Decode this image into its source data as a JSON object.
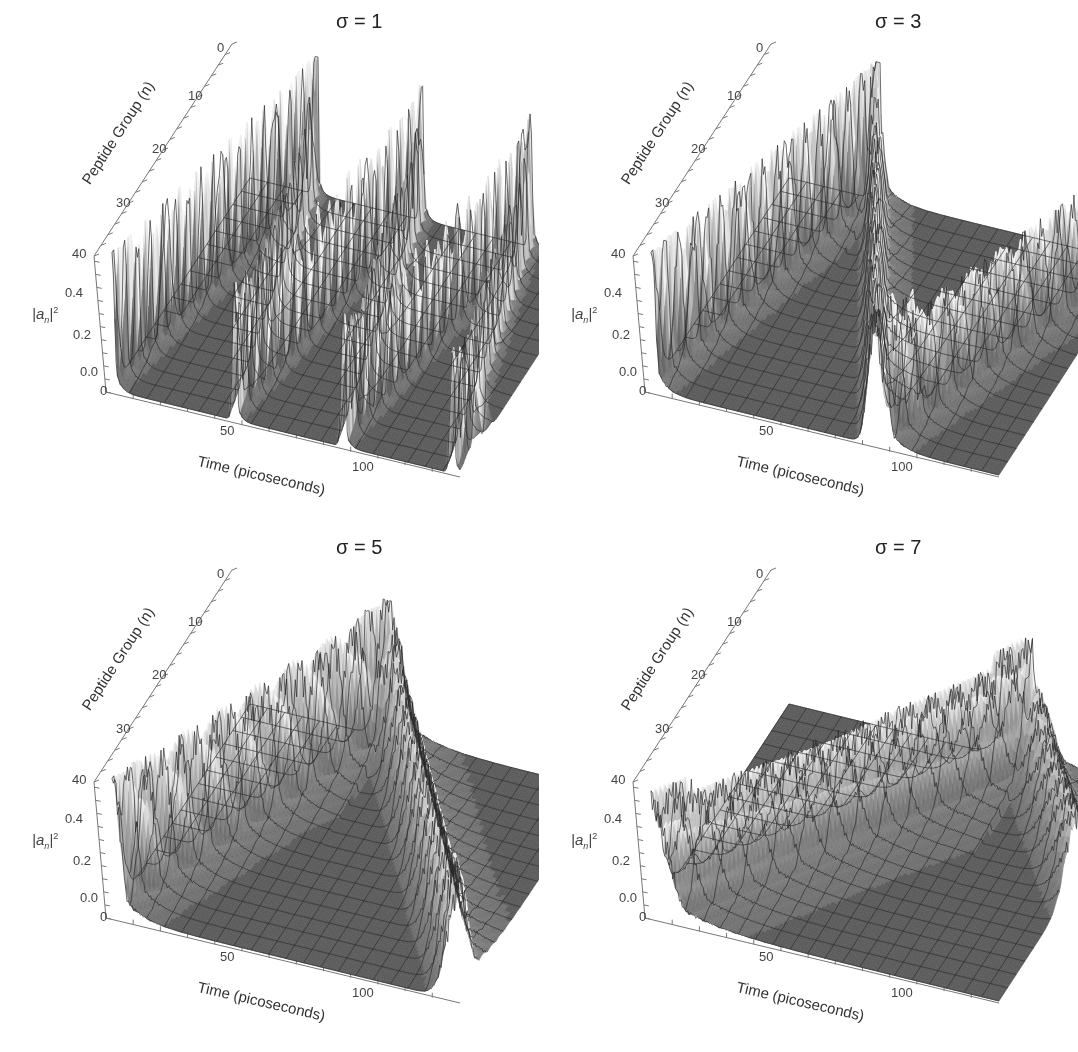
{
  "figure": {
    "panels": [
      {
        "id": "p1",
        "title": "σ = 1",
        "sigma": 1,
        "x": 0,
        "y": 0
      },
      {
        "id": "p2",
        "title": "σ = 3",
        "sigma": 3,
        "x": 539,
        "y": 0
      },
      {
        "id": "p3",
        "title": "σ = 5",
        "sigma": 5,
        "x": 0,
        "y": 526
      },
      {
        "id": "p4",
        "title": "σ = 7",
        "sigma": 7,
        "x": 539,
        "y": 526
      }
    ],
    "axes": {
      "x_title": "Time (picoseconds)",
      "y_title": "Peptide Group (n)",
      "z_title_base": "|a",
      "z_title_sub": "n",
      "z_title_end": "|",
      "z_title_sup": "2",
      "x_ticks": [
        "0",
        "50",
        "100"
      ],
      "y_ticks": [
        "0",
        "10",
        "20",
        "30",
        "40"
      ],
      "z_ticks": [
        "0.0",
        "0.2",
        "0.4"
      ]
    },
    "colors": {
      "surface": "#5c5c5c",
      "grid": "#333333",
      "peak_high": "#f2f2f2",
      "peak_low": "#7a7a7a",
      "axis": "#777777",
      "background": "#ffffff"
    }
  },
  "chart_data": [
    {
      "type": "surface3d",
      "title": "σ = 1",
      "xlabel": "Time (picoseconds)",
      "ylabel": "Peptide Group (n)",
      "zlabel": "|a_n|^2",
      "xlim": [
        0,
        128
      ],
      "ylim": [
        0,
        40
      ],
      "zlim": [
        0,
        0.5
      ],
      "x_ticks": [
        0,
        50,
        100
      ],
      "y_ticks": [
        0,
        10,
        20,
        30,
        40
      ],
      "z_ticks": [
        0.0,
        0.2,
        0.4
      ],
      "description": "Soliton bounces back and forth along the chain repeatedly",
      "ridges": [
        {
          "t_start": 0,
          "n_start": 40,
          "t_end": 24,
          "n_end": 0,
          "peak": 0.5
        },
        {
          "t_start": 24,
          "n_start": 0,
          "t_end": 45,
          "n_end": 40,
          "peak": 0.35
        },
        {
          "t_start": 45,
          "n_start": 40,
          "t_end": 63,
          "n_end": 0,
          "peak": 0.45
        },
        {
          "t_start": 63,
          "n_start": 0,
          "t_end": 85,
          "n_end": 40,
          "peak": 0.35
        },
        {
          "t_start": 85,
          "n_start": 40,
          "t_end": 103,
          "n_end": 0,
          "peak": 0.42
        },
        {
          "t_start": 103,
          "n_start": 0,
          "t_end": 125,
          "n_end": 40,
          "peak": 0.35
        },
        {
          "t_start": 125,
          "n_start": 40,
          "t_end": 128,
          "n_end": 34,
          "peak": 0.4
        }
      ]
    },
    {
      "type": "surface3d",
      "title": "σ = 3",
      "xlabel": "Time (picoseconds)",
      "ylabel": "Peptide Group (n)",
      "zlabel": "|a_n|^2",
      "xlim": [
        0,
        128
      ],
      "ylim": [
        0,
        40
      ],
      "zlim": [
        0,
        0.5
      ],
      "x_ticks": [
        0,
        50,
        100
      ],
      "y_ticks": [
        0,
        10,
        20,
        30,
        40
      ],
      "z_ticks": [
        0.0,
        0.2,
        0.4
      ],
      "description": "Slower soliton, fewer bounces",
      "ridges": [
        {
          "t_start": 0,
          "n_start": 40,
          "t_end": 32,
          "n_end": 0,
          "peak": 0.5
        },
        {
          "t_start": 32,
          "n_start": 0,
          "t_end": 82,
          "n_end": 40,
          "peak": 0.38
        },
        {
          "t_start": 82,
          "n_start": 40,
          "t_end": 88,
          "n_end": 34,
          "peak": 0.45
        },
        {
          "t_start": 85,
          "n_start": 40,
          "t_end": 128,
          "n_end": 0,
          "peak": 0.4
        }
      ]
    },
    {
      "type": "surface3d",
      "title": "σ = 5",
      "xlabel": "Time (picoseconds)",
      "ylabel": "Peptide Group (n)",
      "zlabel": "|a_n|^2",
      "xlim": [
        0,
        128
      ],
      "ylim": [
        0,
        40
      ],
      "zlim": [
        0,
        0.5
      ],
      "x_ticks": [
        0,
        50,
        100
      ],
      "y_ticks": [
        0,
        10,
        20,
        30,
        40
      ],
      "z_ticks": [
        0.0,
        0.2,
        0.4
      ],
      "description": "Soliton travels from n=40 to n=0 in ~50 ps then returns",
      "ridges": [
        {
          "t_start": 0,
          "n_start": 40,
          "t_end": 50,
          "n_end": 0,
          "peak": 0.48
        },
        {
          "t_start": 52,
          "n_start": 0,
          "t_end": 128,
          "n_end": 40,
          "peak": 0.38
        }
      ]
    },
    {
      "type": "surface3d",
      "title": "σ = 7",
      "xlabel": "Time (picoseconds)",
      "ylabel": "Peptide Group (n)",
      "zlabel": "|a_n|^2",
      "xlim": [
        0,
        128
      ],
      "ylim": [
        0,
        40
      ],
      "zlim": [
        0,
        0.5
      ],
      "x_ticks": [
        0,
        50,
        100
      ],
      "y_ticks": [
        0,
        10,
        20,
        30,
        40
      ],
      "z_ticks": [
        0.0,
        0.2,
        0.4
      ],
      "description": "Slow, dispersive soliton; reaches n≈0 at ~90 ps, partial return",
      "ridges": [
        {
          "t_start": 0,
          "n_start": 40,
          "t_end": 88,
          "n_end": 0,
          "peak": 0.38
        },
        {
          "t_start": 90,
          "n_start": 0,
          "t_end": 128,
          "n_end": 18,
          "peak": 0.25
        }
      ]
    }
  ]
}
